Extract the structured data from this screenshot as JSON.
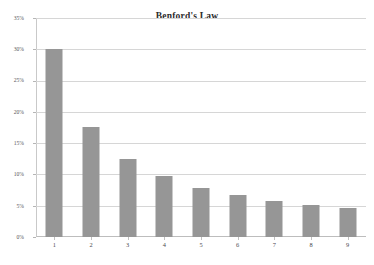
{
  "chart_data": {
    "type": "bar",
    "title": "Benford's Law",
    "xlabel": "",
    "ylabel": "",
    "categories": [
      "1",
      "2",
      "3",
      "4",
      "5",
      "6",
      "7",
      "8",
      "9"
    ],
    "values": [
      30.1,
      17.6,
      12.5,
      9.7,
      7.9,
      6.7,
      5.8,
      5.1,
      4.6
    ],
    "ylim": [
      0,
      35
    ],
    "ytick_labels": [
      "35%",
      "30%",
      "25%",
      "20%",
      "15%",
      "10%",
      "5%",
      "0%"
    ],
    "ytick_values": [
      35,
      30,
      25,
      20,
      15,
      10,
      5,
      0
    ],
    "grid": true,
    "legend": "none",
    "series": [
      {
        "name": "First digit frequency",
        "values": [
          30.1,
          17.6,
          12.5,
          9.7,
          7.9,
          6.7,
          5.8,
          5.1,
          4.6
        ]
      }
    ],
    "colors": {
      "bar": "#969696",
      "gridline": "#d6d6d6",
      "axis": "#bdbdbd",
      "title": "#2b2b2b",
      "tick_label": "#55555a",
      "background": "#ffffff"
    }
  }
}
